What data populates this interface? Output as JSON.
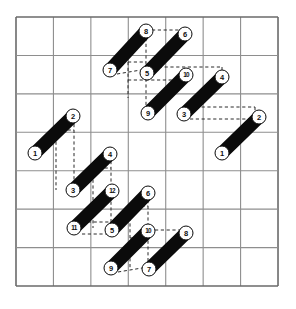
{
  "figure": {
    "kind": "packing-diagram",
    "background_color": "#ffffff",
    "ink_color": "#101010"
  },
  "grid": {
    "name": "square-lattice",
    "columns": 7,
    "rows": 7,
    "x0": 16,
    "y0": 17,
    "cell_w": 37.43,
    "cell_h": 38.43,
    "line_color": "#8e8e8e",
    "border_color": "#6a6a6a",
    "line_width": 1.1,
    "border_width": 1.6
  },
  "piece_style": {
    "thickness": 13.5,
    "fill": "#0b0b0b",
    "cap": "round",
    "label_circle_diameter": 13,
    "label_circle_fill": "#ffffff",
    "label_circle_stroke": "#101010"
  },
  "pieces": [
    {
      "id": "p1",
      "head_label": "8",
      "tail_label": "7",
      "head": [
        146,
        31
      ],
      "tail": [
        110,
        70
      ]
    },
    {
      "id": "p2",
      "head_label": "6",
      "tail_label": "5",
      "head": [
        185,
        34
      ],
      "tail": [
        147,
        73
      ]
    },
    {
      "id": "p3",
      "head_label": "10",
      "tail_label": "9",
      "head": [
        186,
        75
      ],
      "tail": [
        148,
        113
      ]
    },
    {
      "id": "p4",
      "head_label": "4",
      "tail_label": "3",
      "head": [
        222,
        77
      ],
      "tail": [
        184,
        114
      ]
    },
    {
      "id": "p5",
      "head_label": "2",
      "tail_label": "1",
      "head": [
        73,
        116
      ],
      "tail": [
        35,
        153
      ]
    },
    {
      "id": "p6",
      "head_label": "2",
      "tail_label": "1",
      "head": [
        259,
        117
      ],
      "tail": [
        222,
        153
      ]
    },
    {
      "id": "p7",
      "head_label": "4",
      "tail_label": "3",
      "head": [
        110,
        154
      ],
      "tail": [
        73,
        190
      ]
    },
    {
      "id": "p8",
      "head_label": "12",
      "tail_label": "11",
      "head": [
        112,
        191
      ],
      "tail": [
        74,
        228
      ]
    },
    {
      "id": "p9",
      "head_label": "6",
      "tail_label": "5",
      "head": [
        148,
        193
      ],
      "tail": [
        112,
        230
      ]
    },
    {
      "id": "p10",
      "head_label": "10",
      "tail_label": "9",
      "head": [
        148,
        231
      ],
      "tail": [
        111,
        268
      ]
    },
    {
      "id": "p11",
      "head_label": "8",
      "tail_label": "7",
      "head": [
        186,
        233
      ],
      "tail": [
        149,
        269
      ]
    }
  ],
  "dashed_lines": {
    "color": "#2a2a2a",
    "width": 1.0,
    "dash": "3.2 2.6",
    "segments": [
      {
        "name": "d-8-to-6",
        "x1": 152,
        "y1": 30,
        "x2": 180,
        "y2": 30
      },
      {
        "name": "d-7-to-5-slope",
        "x1": 117,
        "y1": 74,
        "x2": 141,
        "y2": 70
      },
      {
        "name": "d-8-vert",
        "x1": 146,
        "y1": 38,
        "x2": 146,
        "y2": 113
      },
      {
        "name": "d-5-vert",
        "x1": 128,
        "y1": 62,
        "x2": 128,
        "y2": 98
      },
      {
        "name": "d-5-top-horiz",
        "x1": 128,
        "y1": 62,
        "x2": 146,
        "y2": 62
      },
      {
        "name": "d-5-bot-horiz",
        "x1": 128,
        "y1": 80,
        "x2": 182,
        "y2": 80
      },
      {
        "name": "d-10-top-horiz",
        "x1": 153,
        "y1": 67,
        "x2": 222,
        "y2": 67
      },
      {
        "name": "d-10-right-vert",
        "x1": 222,
        "y1": 67,
        "x2": 222,
        "y2": 71
      },
      {
        "name": "d-3-top-horiz",
        "x1": 190,
        "y1": 107,
        "x2": 255,
        "y2": 107
      },
      {
        "name": "d-3-bot-horiz",
        "x1": 190,
        "y1": 119,
        "x2": 255,
        "y2": 119
      },
      {
        "name": "d-3-right-vert",
        "x1": 255,
        "y1": 107,
        "x2": 255,
        "y2": 119
      },
      {
        "name": "d-2L-vert-a",
        "x1": 74,
        "y1": 124,
        "x2": 74,
        "y2": 184
      },
      {
        "name": "d-2L-vert-b",
        "x1": 56,
        "y1": 130,
        "x2": 56,
        "y2": 190
      },
      {
        "name": "d-2L-top-horiz",
        "x1": 56,
        "y1": 130,
        "x2": 74,
        "y2": 130
      },
      {
        "name": "d-4-vert",
        "x1": 111,
        "y1": 161,
        "x2": 111,
        "y2": 232
      },
      {
        "name": "d-4-left-vert",
        "x1": 93,
        "y1": 168,
        "x2": 93,
        "y2": 228
      },
      {
        "name": "d-4-top-horiz",
        "x1": 93,
        "y1": 168,
        "x2": 111,
        "y2": 168
      },
      {
        "name": "d-11-horiz",
        "x1": 82,
        "y1": 234,
        "x2": 111,
        "y2": 234
      },
      {
        "name": "d-5b-horiz",
        "x1": 82,
        "y1": 222,
        "x2": 120,
        "y2": 222
      },
      {
        "name": "d-6-vert",
        "x1": 148,
        "y1": 200,
        "x2": 148,
        "y2": 262
      },
      {
        "name": "d-6-left-vert",
        "x1": 130,
        "y1": 206,
        "x2": 130,
        "y2": 268
      },
      {
        "name": "d-6-top-horiz",
        "x1": 130,
        "y1": 206,
        "x2": 148,
        "y2": 206
      },
      {
        "name": "d-10b-horiz",
        "x1": 130,
        "y1": 238,
        "x2": 148,
        "y2": 238
      },
      {
        "name": "d-9-to-7-slope",
        "x1": 118,
        "y1": 272,
        "x2": 142,
        "y2": 268
      },
      {
        "name": "d-10-to-8-slope",
        "x1": 155,
        "y1": 230,
        "x2": 180,
        "y2": 230
      }
    ]
  }
}
